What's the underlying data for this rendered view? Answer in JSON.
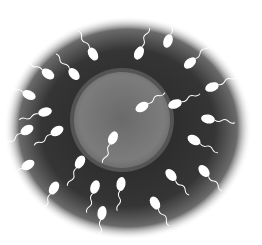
{
  "illustration": {
    "subject": "sperm cells surrounding an egg cell",
    "colors": {
      "background": "#ffffff",
      "halo": "#2e2e2e",
      "egg_fill": "#7a7a7a",
      "egg_rim": "#545454",
      "sperm": "#ffffff"
    },
    "egg": {
      "cx": 122,
      "cy": 120,
      "r": 51
    },
    "sperm_count": 24
  }
}
